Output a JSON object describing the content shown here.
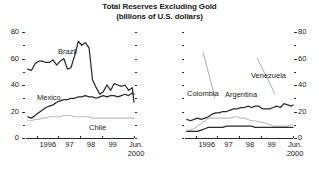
{
  "title": "Total Reserves Excluding Gold",
  "subtitle": "(billions of U.S. dollars)",
  "source_note": "",
  "axis": {
    "y_major_labels": [
      "80",
      "60",
      "40",
      "20",
      "0"
    ],
    "y_major_values": [
      80,
      60,
      40,
      20,
      0
    ],
    "y_minor_values": [
      70,
      50,
      30,
      10
    ],
    "x_labels": [
      "1996",
      "97",
      "98",
      "99",
      "Jun."
    ],
    "x_last_second_line": "2000",
    "ylim": [
      0,
      80
    ],
    "xlim": [
      1995.5,
      2000.5
    ]
  },
  "colors": {
    "dark": "#2b2b2b",
    "mid": "#6e6e6e",
    "light": "#bdbdbd",
    "axis": "#2b2b2b",
    "text": "#1a1a1a"
  },
  "labels": {
    "brazil": "Brazil",
    "mexico": "Mexico",
    "chile": "Chile",
    "colombia": "Colombia",
    "argentina": "Argentina",
    "venezuela": "Venezuela"
  },
  "chart_data": [
    {
      "type": "line",
      "panel": "left",
      "title": "Total Reserves Excluding Gold",
      "subtitle": "(billions of U.S. dollars)",
      "xlabel": "",
      "ylabel": "billions of U.S. dollars",
      "ylim": [
        0,
        80
      ],
      "yticks": [
        0,
        20,
        40,
        60,
        80
      ],
      "yminorticks": [
        10,
        30,
        50,
        70
      ],
      "xticks": [
        1996,
        1997,
        1998,
        1999,
        2000.5
      ],
      "xticklabels": [
        "1996",
        "97",
        "98",
        "99",
        "Jun. 2000"
      ],
      "grid": false,
      "legend": "inline-annotations",
      "x": [
        1995.58,
        1995.75,
        1995.92,
        1996.08,
        1996.25,
        1996.42,
        1996.58,
        1996.75,
        1996.92,
        1997.08,
        1997.25,
        1997.42,
        1997.58,
        1997.75,
        1997.92,
        1998.08,
        1998.25,
        1998.42,
        1998.58,
        1998.75,
        1998.92,
        1999.08,
        1999.25,
        1999.42,
        1999.58,
        1999.75,
        1999.92,
        2000.08,
        2000.25,
        2000.42,
        2000.5
      ],
      "series": [
        {
          "name": "Brazil",
          "color": "#2b2b2b",
          "values": [
            52,
            51,
            56,
            58,
            58,
            57,
            57,
            59,
            55,
            58,
            60,
            52,
            53,
            62,
            73,
            70,
            72,
            68,
            44,
            38,
            33,
            35,
            40,
            36,
            41,
            40,
            39,
            40,
            36,
            38,
            27
          ]
        },
        {
          "name": "Mexico",
          "color": "#2b2b2b",
          "values": [
            16,
            15,
            17,
            19,
            21,
            23,
            24,
            25,
            27,
            28,
            29,
            29,
            30,
            30,
            31,
            31,
            32,
            31,
            31,
            30,
            31,
            32,
            31,
            32,
            32,
            31,
            32,
            33,
            32,
            34,
            33
          ]
        },
        {
          "name": "Chile",
          "color": "#bdbdbd",
          "values": [
            13,
            13,
            14,
            14,
            15,
            15,
            16,
            16,
            16,
            16,
            17,
            17,
            17,
            16,
            16,
            16,
            16,
            16,
            15,
            15,
            15,
            15,
            15,
            15,
            15,
            15,
            15,
            15,
            15,
            15,
            15
          ]
        }
      ]
    },
    {
      "type": "line",
      "panel": "right",
      "title": "Total Reserves Excluding Gold",
      "subtitle": "(billions of U.S. dollars)",
      "xlabel": "",
      "ylabel": "billions of U.S. dollars",
      "ylim": [
        0,
        80
      ],
      "yticks": [
        0,
        20,
        40,
        60,
        80
      ],
      "yminorticks": [
        10,
        30,
        50,
        70
      ],
      "xticks": [
        1996,
        1997,
        1998,
        1999,
        2000.5
      ],
      "xticklabels": [
        "1996",
        "97",
        "98",
        "99",
        "Jun. 2000"
      ],
      "grid": false,
      "legend": "inline-annotations",
      "x": [
        1995.58,
        1995.75,
        1995.92,
        1996.08,
        1996.25,
        1996.42,
        1996.58,
        1996.75,
        1996.92,
        1997.08,
        1997.25,
        1997.42,
        1997.58,
        1997.75,
        1997.92,
        1998.08,
        1998.25,
        1998.42,
        1998.58,
        1998.75,
        1998.92,
        1999.08,
        1999.25,
        1999.42,
        1999.58,
        1999.75,
        1999.92,
        2000.08,
        2000.25,
        2000.42,
        2000.5
      ],
      "series": [
        {
          "name": "Argentina",
          "color": "#2b2b2b",
          "values": [
            14,
            13,
            14,
            15,
            14,
            15,
            16,
            18,
            19,
            19,
            20,
            20,
            21,
            22,
            22,
            23,
            23,
            24,
            23,
            24,
            24,
            22,
            22,
            22,
            23,
            24,
            23,
            26,
            25,
            24,
            25
          ]
        },
        {
          "name": "Venezuela",
          "color": "#bdbdbd",
          "values": [
            6,
            6,
            7,
            9,
            11,
            13,
            15,
            15,
            15,
            15,
            15,
            15,
            15,
            16,
            16,
            15,
            15,
            14,
            13,
            13,
            12,
            12,
            11,
            10,
            9,
            9,
            9,
            9,
            9,
            10,
            10
          ]
        },
        {
          "name": "Colombia",
          "color": "#2b2b2b",
          "values": [
            5,
            5,
            5,
            5,
            6,
            7,
            8,
            8,
            8,
            8,
            8,
            9,
            9,
            9,
            9,
            9,
            9,
            9,
            9,
            8,
            8,
            8,
            8,
            8,
            8,
            8,
            8,
            8,
            8,
            8,
            8
          ]
        }
      ]
    }
  ]
}
